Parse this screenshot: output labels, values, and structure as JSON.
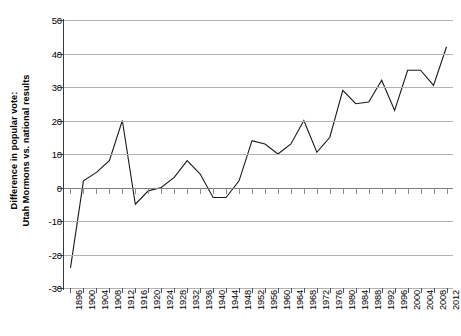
{
  "chart_data": {
    "type": "line",
    "title": "",
    "subtitle": "",
    "xlabel": "",
    "ylabel": "Difference in popular vote: Utah Mormons vs. national results",
    "ylabel_line1": "Difference in popular vote:",
    "ylabel_line2": "Utah Mormons vs. national results",
    "categories": [
      "1896",
      "1900",
      "1904",
      "1908",
      "1912",
      "1916",
      "1920",
      "1924",
      "1928",
      "1932",
      "1936",
      "1940",
      "1944",
      "1948",
      "1952",
      "1956",
      "1960",
      "1964",
      "1968",
      "1972",
      "1976",
      "1980",
      "1984",
      "1988",
      "1992",
      "1996",
      "2000",
      "2004",
      "2008",
      "2012"
    ],
    "values": [
      -24,
      2,
      4.5,
      8,
      20,
      -5,
      -1,
      0,
      3,
      8,
      4,
      -3,
      -3,
      2,
      14,
      13,
      10,
      13,
      20,
      10.5,
      15,
      29,
      25,
      25.5,
      32,
      23,
      35,
      35,
      30.5,
      42
    ],
    "ylim": [
      -30,
      50
    ],
    "ytick_values": [
      50,
      40,
      30,
      20,
      10,
      0,
      -10,
      -20,
      -30
    ],
    "ytick_labels": [
      "50",
      "40",
      "30",
      "20",
      "10",
      "0",
      "-10",
      "-20",
      "-30"
    ],
    "ytick_step": 10,
    "grid": true,
    "grid_axis": "y",
    "legend": false,
    "legend_position": "none",
    "series_color": "#1a1a1a",
    "gridline_color": "#b3b3b3",
    "zero_line_color": "#7f7f7f",
    "axis_color": "#3a3a3a",
    "background_color": "#ffffff",
    "series_name": "Difference in popular vote",
    "xtick_rotation": -90,
    "marker": "none",
    "line_width": 1.1
  }
}
